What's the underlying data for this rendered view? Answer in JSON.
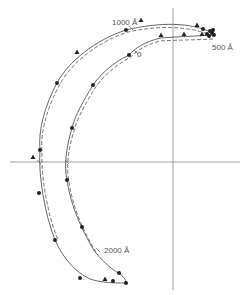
{
  "figure": {
    "colors": {
      "line": "#555555",
      "axis": "#888888",
      "marker": "#222222",
      "background": "#ffffff"
    },
    "axes": {
      "vertical": {
        "x": 173,
        "y1": 8,
        "y2": 290
      },
      "horizontal": {
        "y": 162,
        "x1": 10,
        "x2": 240
      }
    },
    "labels": [
      {
        "id": "label-1000",
        "text": "1000 Å",
        "x": 112,
        "y": 18
      },
      {
        "id": "label-0",
        "text": "0",
        "x": 137,
        "y": 50
      },
      {
        "id": "label-500",
        "text": "500 Å",
        "x": 212,
        "y": 43
      },
      {
        "id": "label-2000",
        "text": "2000 Å",
        "x": 104,
        "y": 246
      }
    ],
    "curves": {
      "outer_solid": "M213,33 C190,22 160,22 126,30 C95,40 68,62 57,83 C45,105 38,130 40,150 C38,175 45,215 55,240 C63,258 75,272 90,279 C102,283 115,283 126,283",
      "outer_dashed": "M213,36 C190,26 160,25 128,32 C97,42 70,64 59,86 C47,108 40,133 42,153 C41,178 48,216 58,240",
      "inner_solid": "M213,35 C195,36 175,37 160,38 C145,42 135,48 129,55 C112,63 100,75 93,85 C84,100 75,115 72,128 C66,148 64,165 67,180 C70,200 76,215 82,228 C88,240 92,248 96,253 C104,263 113,270 120,274 C124,277 126,280 126,283",
      "inner_dashed": "M213,39 C195,40 175,40 160,41 C145,45 136,51 131,57 C114,66 102,78 95,88 C86,103 77,118 74,131 C68,150 66,167 69,182 C72,202 78,217 84,230 C90,242 94,249 98,255"
    },
    "dots": [
      [
        126,
        30
      ],
      [
        57,
        83
      ],
      [
        40,
        150
      ],
      [
        39,
        193
      ],
      [
        55,
        240
      ],
      [
        80,
        278
      ],
      [
        113,
        281
      ],
      [
        126,
        283
      ],
      [
        129,
        55
      ],
      [
        93,
        85
      ],
      [
        72,
        128
      ],
      [
        67,
        180
      ],
      [
        82,
        227
      ],
      [
        119,
        273
      ],
      [
        203,
        29
      ],
      [
        207,
        34
      ],
      [
        210,
        31
      ],
      [
        212,
        33
      ],
      [
        214,
        35
      ],
      [
        213,
        30
      ],
      [
        209,
        36
      ]
    ],
    "triangles": [
      [
        141,
        20
      ],
      [
        77,
        52
      ],
      [
        33,
        157
      ],
      [
        105,
        279
      ],
      [
        197,
        25
      ],
      [
        184,
        34
      ],
      [
        161,
        35
      ],
      [
        202,
        34
      ]
    ],
    "ticks": [
      [
        131,
        28
      ],
      [
        136,
        52
      ],
      [
        98,
        250
      ],
      [
        39,
        162
      ],
      [
        67,
        162
      ]
    ]
  }
}
